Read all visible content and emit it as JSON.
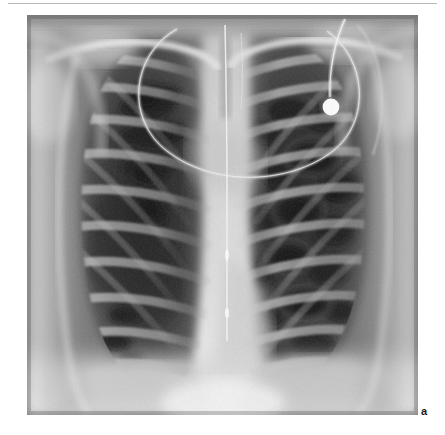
{
  "page": {
    "background_color": "#ffffff",
    "width": 445,
    "height": 435,
    "rule_color": "#b9b9b9"
  },
  "figure": {
    "part_label": "a",
    "caption": "",
    "image": {
      "kind": "radiograph",
      "modality": "X-ray",
      "view": "frontal chest (PA)",
      "alt_text": "Frontal chest radiograph showing bilateral lung fields with mottled cavitary lucencies, a midline catheter and an ECG electrode overlying the left upper chest",
      "frame": {
        "x": 27,
        "y": 15,
        "width": 391,
        "height": 400
      },
      "tone": {
        "lung_dark": "#2b2b2b",
        "lung_mid": "#4a4a4a",
        "soft_tissue": "#8e8e8e",
        "mediastinum": "#cfcfcf",
        "bone_bright": "#e9e9e9",
        "device_white": "#ffffff",
        "background_black": "#1b1b1b"
      },
      "findings": [
        "bilateral coarse reticulonodular and cavitary lucencies",
        "widened bright central mediastinal shadow",
        "ribs and clavicles projected over both lung fields",
        "elevated bright hemidiaphragm shadows inferiorly"
      ],
      "devices": [
        {
          "name": "ecg-electrode",
          "label": "ECG electrode snap",
          "shape": "filled circle",
          "cx": 304,
          "cy": 92,
          "r": 8.5,
          "color": "#ffffff"
        },
        {
          "name": "electrode-lead-wire",
          "label": "electrode lead wire",
          "shape": "thin vertical curved line",
          "color": "#e6e6e6"
        },
        {
          "name": "ecg-cable-loop",
          "label": "ECG cable loop",
          "shape": "large arc across upper chest",
          "color": "#d8d8d8"
        },
        {
          "name": "midline-catheter",
          "label": "midline catheter / nasogastric tube",
          "shape": "thin vertical line in midline",
          "color": "#efefef"
        }
      ]
    }
  }
}
